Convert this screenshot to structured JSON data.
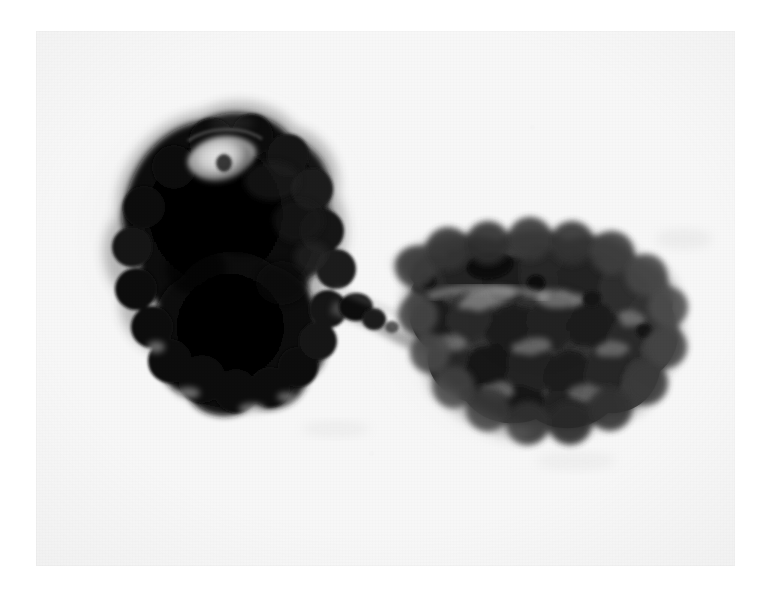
{
  "image": {
    "kind": "photomicrograph",
    "modality": "brightfield light microscopy",
    "rendering": "grayscale",
    "width_px": 766,
    "height_px": 608,
    "caption": "",
    "visible_text": "",
    "plate": {
      "left_px": 36,
      "top_px": 31,
      "width_px": 699,
      "height_px": 535,
      "background_hex": "#f7f7f7",
      "paper_margin_hex": "#ffffff"
    },
    "palette": {
      "paper_white": "#ffffff",
      "film_base": "#f7f7f7",
      "background_gray": "#f2f2f2",
      "halo_gray": "#e2e2e2",
      "mid_gray": "#8a8a8a",
      "dark_gray": "#4a4a4a",
      "deep_gray": "#2a2a2a",
      "near_black": "#111111",
      "black": "#060606",
      "highlight_white": "#efefef"
    }
  },
  "specimen": {
    "description": "Two stained cells joined by a slender cytoplasmic bridge, forming an elongated doublet that runs from upper-left to lower-right across the field.",
    "objects": [
      {
        "id": "cell-left",
        "label": "left cell",
        "appearance": "densely stained, almost opaque black, elongated ovoid with a knobby lobulated margin",
        "orientation": "long axis from upper-left to lower-right",
        "bbox_px": [
          85,
          113,
          262,
          292
        ],
        "centroid_px": [
          215,
          258
        ],
        "tone_hex": "#0b0b0b",
        "features": [
          {
            "id": "left-nucleus-highlight",
            "label": "pale oval inclusion",
            "appearance": "bright lens-shaped clear zone with a small dark granule at its centre",
            "center_px": [
              219,
              157
            ],
            "size_px": [
              62,
              44
            ],
            "tone_hex": "#d9d9d9"
          },
          {
            "id": "left-upper-highlight",
            "label": "small pale notch at upper margin",
            "center_px": [
              178,
              126
            ],
            "size_px": [
              34,
              15
            ],
            "tone_hex": "#c9c9c9"
          },
          {
            "id": "left-lobed-margin",
            "label": "blebbed lower margin",
            "appearance": "series of rounded bulges along the lower-left border"
          }
        ]
      },
      {
        "id": "cytoplasmic-bridge",
        "label": "intercellular bridge",
        "appearance": "narrow pale strand linking the two cells, carrying two small dark beads",
        "bbox_px": [
          336,
          283,
          76,
          58
        ],
        "tone_hex": "#3a3a3a",
        "beads": [
          {
            "center_px": [
              356,
              305
            ],
            "radius_px": 11,
            "tone_hex": "#141414"
          },
          {
            "center_px": [
              374,
              318
            ],
            "radius_px": 8,
            "tone_hex": "#1d1d1d"
          }
        ]
      },
      {
        "id": "cell-right",
        "label": "right cell",
        "appearance": "broad, coarsely granular and vesicular mass of medium-to-dark grey lobules with paler interstices",
        "orientation": "long axis roughly horizontal, tilted slightly down to the right",
        "bbox_px": [
          396,
          248,
          268,
          176
        ],
        "centroid_px": [
          528,
          332
        ],
        "tone_hex": "#3e3e3e",
        "features": [
          {
            "id": "right-dark-vesicle",
            "label": "prominent dark vesicle near upper margin",
            "center_px": [
              490,
              266
            ],
            "size_px": [
              40,
              22
            ],
            "tone_hex": "#090909"
          },
          {
            "id": "right-pale-channel",
            "label": "pale cleft running across the upper third",
            "center_px": [
              486,
              286
            ],
            "tone_hex": "#9c9c9c"
          },
          {
            "id": "right-granules",
            "label": "cluster of rounded dark granules filling the body"
          }
        ]
      }
    ]
  }
}
